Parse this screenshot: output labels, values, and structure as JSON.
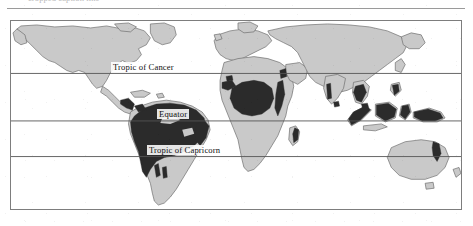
{
  "document": {
    "cropped_caption_text": "cropped caption line",
    "figure_type": "world-map"
  },
  "map": {
    "title": "World map showing tropical rainforest distribution",
    "frame": {
      "x": 10,
      "y": 20,
      "width": 452,
      "height": 190
    },
    "colors": {
      "land": "#c9c9c9",
      "land_outline": "#6e6e6e",
      "rainforest": "#2b2b2b",
      "ocean": "#ffffff",
      "frame_border": "#7d7d7d",
      "latitude_line": "#555555",
      "label_text": "#0f0f0f"
    },
    "latitude_lines": [
      {
        "name": "tropic-of-cancer",
        "label": "Tropic of Cancer",
        "y": 53
      },
      {
        "name": "equator",
        "label": "Equator",
        "y": 101
      },
      {
        "name": "tropic-of-capricorn",
        "label": "Tropic of Capricorn",
        "y": 137
      }
    ],
    "legend_items": [
      {
        "key": "rainforest",
        "label": "Tropical rainforest",
        "color": "#2b2b2b"
      },
      {
        "key": "land",
        "label": "Land",
        "color": "#c9c9c9"
      }
    ],
    "landmasses": [
      "North America",
      "South America",
      "Greenland",
      "Europe",
      "Africa",
      "Asia",
      "Southeast Asian archipelago",
      "Australia",
      "New Zealand",
      "Madagascar"
    ],
    "rainforest_regions": [
      "Amazon Basin",
      "Central America",
      "Congo Basin",
      "West Africa",
      "East Africa highlands",
      "Madagascar",
      "Western Ghats",
      "Indochina",
      "Sumatra",
      "Borneo",
      "Sulawesi",
      "New Guinea",
      "Queensland coast"
    ]
  }
}
